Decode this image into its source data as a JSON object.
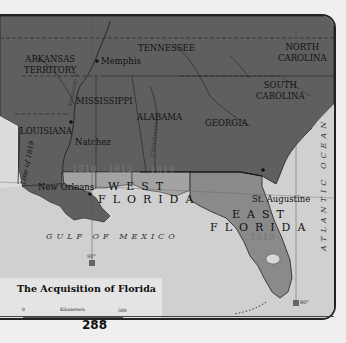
{
  "map": {
    "title": "The Acquisition of Florida",
    "page_number": "288",
    "states": [
      {
        "id": "arkansas",
        "label": "ARKANSAS\nTERRITORY"
      },
      {
        "id": "tennessee",
        "label": "TENNESSEE"
      },
      {
        "id": "north-carolina",
        "label": "NORTH\nCAROLINA"
      },
      {
        "id": "south-carolina",
        "label": "SOUTH\nCAROLINA"
      },
      {
        "id": "mississippi",
        "label": "MISSISSIPPI"
      },
      {
        "id": "alabama",
        "label": "ALABAMA"
      },
      {
        "id": "georgia",
        "label": "GEORGIA"
      },
      {
        "id": "louisiana",
        "label": "LOUISIANA"
      }
    ],
    "cities": [
      {
        "id": "memphis",
        "label": "Memphis"
      },
      {
        "id": "natchez",
        "label": "Natchez"
      },
      {
        "id": "new-orleans",
        "label": "New Orleans"
      },
      {
        "id": "st-augustine",
        "label": "St. Augustine"
      }
    ],
    "regions": {
      "west_florida": {
        "line1": "WEST",
        "line2": "FLORIDA"
      },
      "east_florida": {
        "line1": "EAST",
        "line2": "FLORIDA"
      }
    },
    "acquisition_years": [
      "1810",
      "1813",
      "1819",
      "1819"
    ],
    "water_bodies": {
      "gulf": "GULF OF MEXICO",
      "atlantic": "ATLANTIC OCEAN"
    },
    "rivers": {
      "mississippi": "Mississippi R.",
      "chattahoochee": "Chattahoochee R."
    },
    "line_of_1819": "Line of 1819",
    "longitudes": {
      "left": "90°",
      "right": "80°"
    },
    "scale": {
      "km_label": "Kilometers",
      "km_min": "0",
      "km_max": "500",
      "mi_label": "Miles",
      "mi_min": "0",
      "mi_max": "300"
    },
    "colors": {
      "us_territory": "#5f5f5f",
      "acquired_1810_1813": "#a3a3a3",
      "east_florida": "#8a8a8a",
      "water": "#d0d0d0",
      "spanish_area": "#a0a0a0"
    }
  }
}
